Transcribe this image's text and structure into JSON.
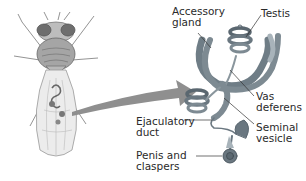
{
  "diagram": {
    "labels": {
      "accessory_gland": "Accessory\ngland",
      "testis": "Testis",
      "vas_deferens": "Vas\ndeferens",
      "ejaculatory_duct": "Ejaculatory\nduct",
      "seminal_vesicle": "Seminal\nvesicle",
      "penis_claspers": "Penis and\nclaspers"
    },
    "colors": {
      "organ": "#7d8a92",
      "organ_dark": "#5a6770",
      "organ_light": "#a8b3ba",
      "arrow": "#8f8f8f",
      "fly": "#8a8a8a",
      "leader": "#333333",
      "text": "#2a2a2a"
    }
  }
}
